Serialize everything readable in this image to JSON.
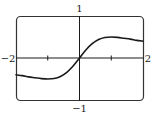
{
  "chart_data": {
    "type": "line",
    "title": "",
    "xlabel": "",
    "ylabel": "",
    "xlim": [
      -2,
      2
    ],
    "ylim": [
      -1,
      1
    ],
    "grid": false,
    "legend": null,
    "tick_labels": {
      "x_left": "−2",
      "x_right": "2",
      "y_top": "1",
      "y_bottom": "−1"
    },
    "x_ticks": [
      -1,
      1
    ],
    "series": [
      {
        "name": "curve",
        "x": [
          -2,
          -1.8,
          -1.6,
          -1.4,
          -1.2,
          -1.0,
          -0.8,
          -0.6,
          -0.4,
          -0.2,
          0,
          0.2,
          0.4,
          0.6,
          0.8,
          1.0,
          1.2,
          1.4,
          1.6,
          1.8,
          2.0
        ],
        "y": [
          -0.4,
          -0.42,
          -0.45,
          -0.47,
          -0.49,
          -0.5,
          -0.49,
          -0.44,
          -0.34,
          -0.19,
          0,
          0.19,
          0.34,
          0.44,
          0.49,
          0.5,
          0.49,
          0.47,
          0.45,
          0.42,
          0.4
        ]
      }
    ],
    "colors": {
      "line": "#1a1a1a",
      "frame": "#333333",
      "axes": "#1a1a1a"
    }
  }
}
